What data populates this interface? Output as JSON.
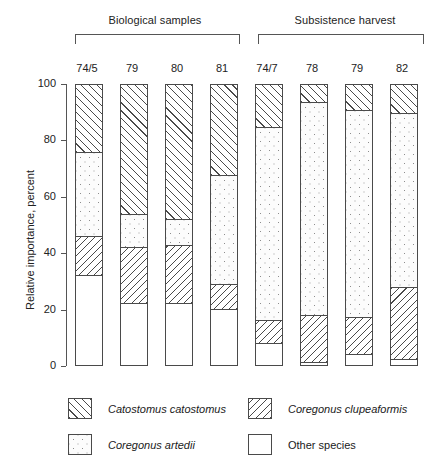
{
  "chart_data": {
    "type": "bar",
    "subtype": "stacked-100-percent",
    "title": "",
    "xlabel": "",
    "ylabel": "Relative importance, percent",
    "ylim": [
      0,
      100
    ],
    "yticks": [
      0,
      20,
      40,
      60,
      80,
      100
    ],
    "ytick_labels": [
      "0",
      "20",
      "40",
      "60",
      "80",
      "100"
    ],
    "grid": false,
    "legend_position": "bottom",
    "group_labels": [
      "Biological samples",
      "Subsistence harvest"
    ],
    "groups": [
      {
        "label": "Biological samples",
        "categories": [
          "74/5",
          "79",
          "80",
          "81"
        ]
      },
      {
        "label": "Subsistence harvest",
        "categories": [
          "74/7",
          "78",
          "79",
          "82"
        ]
      }
    ],
    "categories": [
      "74/5",
      "79",
      "80",
      "81",
      "74/7",
      "78",
      "79",
      "82"
    ],
    "series": [
      {
        "name": "Catostomus catostomus",
        "key": "cat",
        "values": [
          24,
          46,
          48,
          32,
          15,
          6,
          9,
          10
        ]
      },
      {
        "name": "Coregonus artedii",
        "key": "art",
        "values": [
          30,
          12,
          9,
          39,
          69,
          76,
          74,
          62
        ]
      },
      {
        "name": "Coregonus clupeaformis",
        "key": "clu",
        "values": [
          14,
          20,
          21,
          9,
          8,
          17,
          13,
          26
        ]
      },
      {
        "name": "Other species",
        "key": "oth",
        "values": [
          32,
          22,
          22,
          20,
          8,
          1,
          4,
          2
        ]
      }
    ],
    "stack_order_bottom_to_top": [
      "Other species",
      "Coregonus clupeaformis",
      "Coregonus artedii",
      "Catostomus catostomus"
    ],
    "boundaries_percent": [
      {
        "category": "74/5",
        "oth_top": 32,
        "clu_top": 46,
        "art_top": 76
      },
      {
        "category": "79",
        "oth_top": 22,
        "clu_top": 42,
        "art_top": 54
      },
      {
        "category": "80",
        "oth_top": 22,
        "clu_top": 43,
        "art_top": 52
      },
      {
        "category": "81",
        "oth_top": 20,
        "clu_top": 29,
        "art_top": 68
      },
      {
        "category": "74/7",
        "oth_top": 8,
        "clu_top": 16,
        "art_top": 85
      },
      {
        "category": "78",
        "oth_top": 1,
        "clu_top": 18,
        "art_top": 94
      },
      {
        "category": "79",
        "oth_top": 4,
        "clu_top": 17,
        "art_top": 91
      },
      {
        "category": "82",
        "oth_top": 2,
        "clu_top": 28,
        "art_top": 90
      }
    ]
  },
  "axis": {
    "ylabel": "Relative importance, percent",
    "ticks": [
      {
        "value": 100,
        "label": "100"
      },
      {
        "value": 80,
        "label": "80"
      },
      {
        "value": 60,
        "label": "60"
      },
      {
        "value": 40,
        "label": "40"
      },
      {
        "value": 20,
        "label": "20"
      },
      {
        "value": 0,
        "label": "0"
      }
    ]
  },
  "legend": {
    "items": [
      {
        "label": "Catostomus catostomus",
        "pattern": "diagonal-hatch-right",
        "italic": true
      },
      {
        "label": "Coregonus clupeaformis",
        "pattern": "diagonal-hatch-left",
        "italic": true
      },
      {
        "label": "Coregonus artedii",
        "pattern": "stipple-dots",
        "italic": true
      },
      {
        "label": "Other species",
        "pattern": "blank-white",
        "italic": false
      }
    ]
  },
  "colors": {
    "line": "#4a4a4a",
    "text": "#1a1a1a",
    "background": "#ffffff"
  }
}
